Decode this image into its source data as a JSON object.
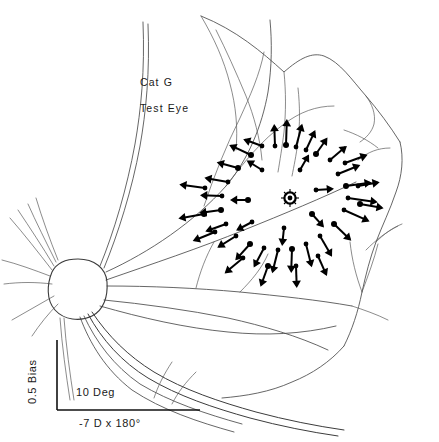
{
  "figure": {
    "domain_kind": "scientific-line-drawing",
    "background_color": "#ffffff",
    "ink_color": "#000000",
    "vessel_color": "#4a4a4a",
    "width": 439,
    "height": 442,
    "annotations": {
      "subject_label": "Cat G",
      "eye_label": "Test Eye",
      "horizontal_scale_label": "10 Deg",
      "refraction_label": "-7 D x 180°",
      "vertical_scale_label": "0.5 Bias"
    },
    "scale_bars": {
      "horizontal": {
        "label": "10 Deg",
        "x1": 57,
        "x2": 200,
        "y": 410
      },
      "vertical": {
        "label": "0.5 Bias",
        "x": 57,
        "y1": 340,
        "y2": 410
      }
    },
    "landmarks": [
      {
        "name": "optic-disc",
        "cx": 78,
        "cy": 288,
        "r": 29
      },
      {
        "name": "area-centralis-marker",
        "cx": 290,
        "cy": 198,
        "r": 7
      }
    ]
  },
  "chart_data": {
    "type": "scatter",
    "title": "Cat G Test Eye",
    "subtitle": "-7 D x 180°",
    "xlabel": "10 Deg",
    "ylabel": "0.5 Bias",
    "grid": false,
    "legend": null,
    "vectors": [
      {
        "x": 251,
        "y": 155,
        "angle": 205,
        "len": 22
      },
      {
        "x": 262,
        "y": 146,
        "angle": 200,
        "len": 18
      },
      {
        "x": 275,
        "y": 146,
        "angle": 268,
        "len": 20
      },
      {
        "x": 286,
        "y": 145,
        "angle": 272,
        "len": 24
      },
      {
        "x": 296,
        "y": 147,
        "angle": 285,
        "len": 22
      },
      {
        "x": 306,
        "y": 150,
        "angle": 295,
        "len": 20
      },
      {
        "x": 316,
        "y": 154,
        "angle": 305,
        "len": 18
      },
      {
        "x": 330,
        "y": 160,
        "angle": 320,
        "len": 20
      },
      {
        "x": 345,
        "y": 163,
        "angle": 340,
        "len": 22
      },
      {
        "x": 238,
        "y": 168,
        "angle": 195,
        "len": 20
      },
      {
        "x": 228,
        "y": 182,
        "angle": 190,
        "len": 22
      },
      {
        "x": 222,
        "y": 196,
        "angle": 182,
        "len": 20
      },
      {
        "x": 221,
        "y": 210,
        "angle": 172,
        "len": 20
      },
      {
        "x": 226,
        "y": 224,
        "angle": 160,
        "len": 20
      },
      {
        "x": 236,
        "y": 236,
        "angle": 148,
        "len": 20
      },
      {
        "x": 250,
        "y": 244,
        "angle": 132,
        "len": 20
      },
      {
        "x": 264,
        "y": 248,
        "angle": 118,
        "len": 20
      },
      {
        "x": 278,
        "y": 250,
        "angle": 104,
        "len": 22
      },
      {
        "x": 292,
        "y": 249,
        "angle": 92,
        "len": 22
      },
      {
        "x": 306,
        "y": 244,
        "angle": 76,
        "len": 22
      },
      {
        "x": 320,
        "y": 236,
        "angle": 60,
        "len": 22
      },
      {
        "x": 334,
        "y": 224,
        "angle": 44,
        "len": 22
      },
      {
        "x": 344,
        "y": 210,
        "angle": 24,
        "len": 26
      },
      {
        "x": 348,
        "y": 198,
        "angle": 8,
        "len": 28
      },
      {
        "x": 346,
        "y": 186,
        "angle": 352,
        "len": 24
      },
      {
        "x": 338,
        "y": 174,
        "angle": 338,
        "len": 22
      },
      {
        "x": 205,
        "y": 188,
        "angle": 188,
        "len": 24
      },
      {
        "x": 204,
        "y": 214,
        "angle": 170,
        "len": 24
      },
      {
        "x": 215,
        "y": 232,
        "angle": 158,
        "len": 22
      },
      {
        "x": 243,
        "y": 258,
        "angle": 140,
        "len": 22
      },
      {
        "x": 268,
        "y": 266,
        "angle": 110,
        "len": 20
      },
      {
        "x": 296,
        "y": 266,
        "angle": 88,
        "len": 20
      },
      {
        "x": 318,
        "y": 256,
        "angle": 66,
        "len": 20
      },
      {
        "x": 360,
        "y": 204,
        "angle": 10,
        "len": 22
      },
      {
        "x": 358,
        "y": 186,
        "angle": 350,
        "len": 20
      },
      {
        "x": 262,
        "y": 170,
        "angle": 212,
        "len": 16
      },
      {
        "x": 248,
        "y": 200,
        "angle": 180,
        "len": 16
      },
      {
        "x": 252,
        "y": 222,
        "angle": 152,
        "len": 16
      },
      {
        "x": 284,
        "y": 228,
        "angle": 96,
        "len": 16
      },
      {
        "x": 312,
        "y": 214,
        "angle": 48,
        "len": 16
      },
      {
        "x": 316,
        "y": 190,
        "angle": 356,
        "len": 16
      },
      {
        "x": 300,
        "y": 170,
        "angle": 300,
        "len": 16
      }
    ]
  }
}
